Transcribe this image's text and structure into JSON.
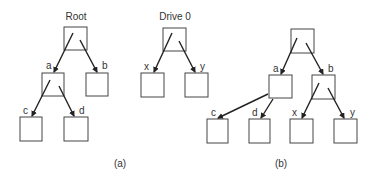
{
  "diagram": {
    "panel_a": {
      "caption": "(a)",
      "trees": [
        {
          "title": "Root",
          "nodes": [
            {
              "id": "root",
              "label": ""
            },
            {
              "id": "a",
              "label": "a"
            },
            {
              "id": "b",
              "label": "b"
            },
            {
              "id": "c",
              "label": "c"
            },
            {
              "id": "d",
              "label": "d"
            }
          ],
          "edges": [
            [
              "root",
              "a"
            ],
            [
              "root",
              "b"
            ],
            [
              "a",
              "c"
            ],
            [
              "a",
              "d"
            ]
          ]
        },
        {
          "title": "Drive 0",
          "nodes": [
            {
              "id": "drive0",
              "label": ""
            },
            {
              "id": "x",
              "label": "x"
            },
            {
              "id": "y",
              "label": "y"
            }
          ],
          "edges": [
            [
              "drive0",
              "x"
            ],
            [
              "drive0",
              "y"
            ]
          ]
        }
      ]
    },
    "panel_b": {
      "caption": "(b)",
      "nodes": [
        {
          "id": "root",
          "label": ""
        },
        {
          "id": "a",
          "label": "a"
        },
        {
          "id": "b",
          "label": "b"
        },
        {
          "id": "c",
          "label": "c"
        },
        {
          "id": "d",
          "label": "d"
        },
        {
          "id": "x",
          "label": "x"
        },
        {
          "id": "y",
          "label": "y"
        }
      ],
      "edges": [
        [
          "root",
          "a"
        ],
        [
          "root",
          "b"
        ],
        [
          "a",
          "c"
        ],
        [
          "a",
          "d"
        ],
        [
          "b",
          "x"
        ],
        [
          "b",
          "y"
        ]
      ]
    }
  }
}
